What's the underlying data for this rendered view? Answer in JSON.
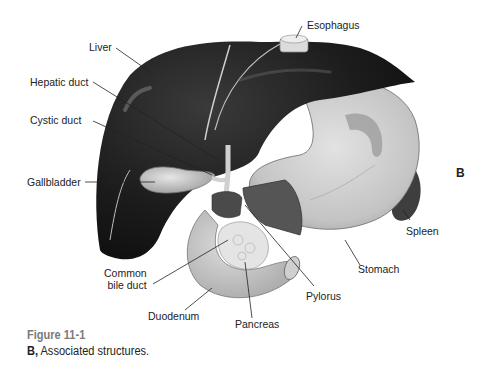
{
  "figure": {
    "panel_letter": "B",
    "caption_title": "Figure 11-1",
    "caption_prefix": "B,",
    "caption_text": " Associated structures."
  },
  "labels": {
    "esophagus": "Esophagus",
    "liver": "Liver",
    "hepatic_duct": "Hepatic duct",
    "cystic_duct": "Cystic duct",
    "gallbladder": "Gallbladder",
    "common_bile_duct_line1": "Common",
    "common_bile_duct_line2": "bile duct",
    "duodenum": "Duodenum",
    "pancreas": "Pancreas",
    "pylorus": "Pylorus",
    "stomach": "Stomach",
    "spleen": "Spleen"
  },
  "colors": {
    "liver": "#1e1e1e",
    "stomach": "#cfcfcf",
    "gallbladder": "#c8c8c8",
    "spleen": "#4a4a4a",
    "caption_title": "#7a7a7a",
    "text": "#222222"
  }
}
